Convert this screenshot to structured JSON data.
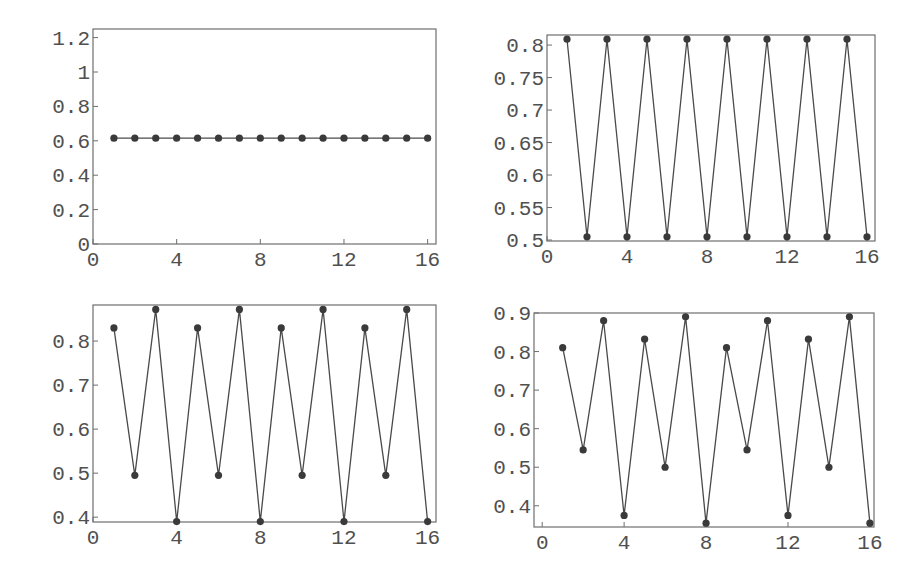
{
  "figure": {
    "width": 919,
    "height": 580,
    "colors": {
      "frame": "#6e6e6e",
      "line": "#4a4a4a",
      "point": "#3a3a3a",
      "text": "#505050"
    }
  },
  "chart_data": [
    {
      "id": "top-left",
      "type": "line",
      "title": "",
      "xlabel": "",
      "ylabel": "",
      "markers": true,
      "grid": false,
      "x": [
        1,
        2,
        3,
        4,
        5,
        6,
        7,
        8,
        9,
        10,
        11,
        12,
        13,
        14,
        15,
        16
      ],
      "values": [
        0.615,
        0.615,
        0.615,
        0.615,
        0.615,
        0.615,
        0.615,
        0.615,
        0.615,
        0.615,
        0.615,
        0.615,
        0.615,
        0.615,
        0.615,
        0.615
      ],
      "xlim": [
        0,
        16.4
      ],
      "ylim": [
        0,
        1.25
      ],
      "xticks": [
        0,
        4,
        8,
        12,
        16
      ],
      "xtick_labels": [
        "0",
        "4",
        "8",
        "12",
        "16"
      ],
      "yticks": [
        0,
        0.2,
        0.4,
        0.6,
        0.8,
        1,
        1.2
      ],
      "ytick_labels": [
        "0",
        "0.2",
        "0.4",
        "0.6",
        "0.8",
        "1",
        "1.2"
      ],
      "box": {
        "left": 93,
        "top": 29,
        "right": 436,
        "bottom": 244
      }
    },
    {
      "id": "top-right",
      "type": "line",
      "title": "",
      "xlabel": "",
      "ylabel": "",
      "markers": true,
      "grid": false,
      "x": [
        1,
        2,
        3,
        4,
        5,
        6,
        7,
        8,
        9,
        10,
        11,
        12,
        13,
        14,
        15,
        16
      ],
      "values": [
        0.809,
        0.505,
        0.809,
        0.505,
        0.809,
        0.505,
        0.809,
        0.505,
        0.809,
        0.505,
        0.809,
        0.505,
        0.809,
        0.505,
        0.809,
        0.505
      ],
      "xlim": [
        0,
        16.4
      ],
      "ylim": [
        0.4985,
        0.8155
      ],
      "xticks": [
        0,
        4,
        8,
        12,
        16
      ],
      "xtick_labels": [
        "0",
        "4",
        "8",
        "12",
        "16"
      ],
      "yticks": [
        0.5,
        0.55,
        0.6,
        0.65,
        0.7,
        0.75,
        0.8
      ],
      "ytick_labels": [
        "0.5",
        "0.55",
        "0.6",
        "0.65",
        "0.7",
        "0.75",
        "0.8"
      ],
      "box": {
        "left": 547,
        "top": 35,
        "right": 875,
        "bottom": 241
      }
    },
    {
      "id": "bottom-left",
      "type": "line",
      "title": "",
      "xlabel": "",
      "ylabel": "",
      "markers": true,
      "grid": false,
      "x": [
        1,
        2,
        3,
        4,
        5,
        6,
        7,
        8,
        9,
        10,
        11,
        12,
        13,
        14,
        15,
        16
      ],
      "values": [
        0.83,
        0.495,
        0.872,
        0.39,
        0.83,
        0.495,
        0.872,
        0.39,
        0.83,
        0.495,
        0.872,
        0.39,
        0.83,
        0.495,
        0.872,
        0.39
      ],
      "xlim": [
        0,
        16.4
      ],
      "ylim": [
        0.389,
        0.882
      ],
      "xticks": [
        0,
        4,
        8,
        12,
        16
      ],
      "xtick_labels": [
        "0",
        "4",
        "8",
        "12",
        "16"
      ],
      "yticks": [
        0.4,
        0.5,
        0.6,
        0.7,
        0.8
      ],
      "ytick_labels": [
        "0.4",
        "0.5",
        "0.6",
        "0.7",
        "0.8"
      ],
      "box": {
        "left": 93,
        "top": 305,
        "right": 436,
        "bottom": 522
      }
    },
    {
      "id": "bottom-right",
      "type": "line",
      "title": "",
      "xlabel": "",
      "ylabel": "",
      "markers": true,
      "grid": false,
      "x": [
        1,
        2,
        3,
        4,
        5,
        6,
        7,
        8,
        9,
        10,
        11,
        12,
        13,
        14,
        15,
        16
      ],
      "values": [
        0.81,
        0.545,
        0.88,
        0.375,
        0.832,
        0.5,
        0.89,
        0.355,
        0.81,
        0.545,
        0.88,
        0.375,
        0.832,
        0.5,
        0.89,
        0.355
      ],
      "xlim": [
        -0.4,
        16.2
      ],
      "ylim": [
        0.345,
        0.9
      ],
      "xticks": [
        0,
        4,
        8,
        12,
        16
      ],
      "xtick_labels": [
        "0",
        "4",
        "8",
        "12",
        "16"
      ],
      "yticks": [
        0.4,
        0.5,
        0.6,
        0.7,
        0.8,
        0.9
      ],
      "ytick_labels": [
        "0.4",
        "0.5",
        "0.6",
        "0.7",
        "0.8",
        "0.9"
      ],
      "box": {
        "left": 534,
        "top": 313,
        "right": 874,
        "bottom": 527
      }
    }
  ]
}
